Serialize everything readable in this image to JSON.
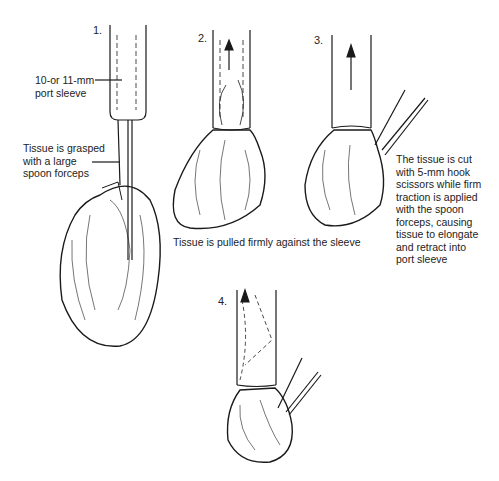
{
  "figure": {
    "steps": [
      {
        "number": "1.",
        "annotations": [
          {
            "lines": [
              "10-or 11-mm",
              "port sleeve"
            ]
          },
          {
            "lines": [
              "Tissue is grasped",
              "with a large",
              "spoon forceps"
            ]
          }
        ]
      },
      {
        "number": "2."
      },
      {
        "number": "3.",
        "annotations": [
          {
            "lines": [
              "The tissue is cut",
              "with 5-mm hook",
              "scissors while firm",
              "traction is applied",
              "with the spoon",
              "forceps, causing",
              "tissue to elongate",
              "and retract into",
              "port sleeve"
            ]
          }
        ]
      },
      {
        "number": "4."
      }
    ],
    "caption_2_3": "Tissue is pulled firmly against the sleeve",
    "colors": {
      "ink": "#1a1a1a",
      "background": "#ffffff"
    }
  }
}
